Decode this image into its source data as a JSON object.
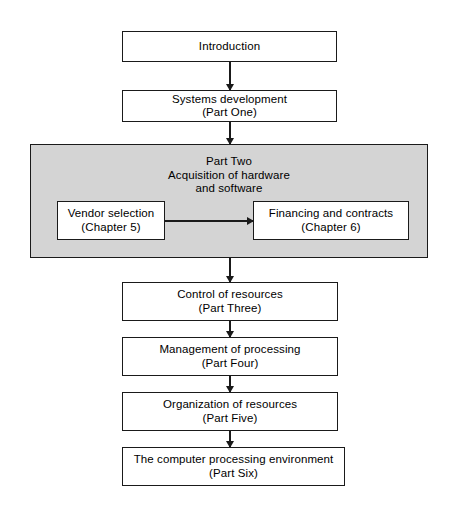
{
  "diagram": {
    "type": "flowchart",
    "orientation": "vertical",
    "background_color": "#ffffff",
    "line_color": "#1a1a1a",
    "panel_fill_color": "#d4d4d4",
    "nodes": [
      {
        "id": "introduction",
        "line1": "Introduction",
        "line2": ""
      },
      {
        "id": "systems-development",
        "line1": "Systems development",
        "line2": "(Part One)"
      },
      {
        "id": "control-of-resources",
        "line1": "Control of resources",
        "line2": "(Part Three)"
      },
      {
        "id": "management-of-processing",
        "line1": "Management of processing",
        "line2": "(Part Four)"
      },
      {
        "id": "organization-of-resources",
        "line1": "Organization of resources",
        "line2": "(Part Five)"
      },
      {
        "id": "computer-processing-environment",
        "line1": "The computer processing environment",
        "line2": "(Part Six)"
      }
    ],
    "panel": {
      "id": "part-two-panel",
      "heading_line1": "Part Two",
      "heading_line2": "Acquisition of hardware",
      "heading_line3": "and software",
      "children": [
        {
          "id": "vendor-selection",
          "line1": "Vendor selection",
          "line2": "(Chapter 5)"
        },
        {
          "id": "financing-and-contracts",
          "line1": "Financing and contracts",
          "line2": "(Chapter 6)"
        }
      ]
    }
  }
}
